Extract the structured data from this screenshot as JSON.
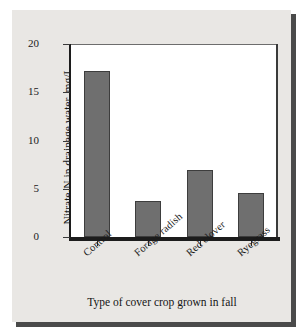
{
  "figure": {
    "background_color": "#e9e7e4",
    "plot_background_color": "#ffffff",
    "bar_color": "#6f6f6f",
    "bar_edge_color": "#3d3d3d",
    "axis_color": "#1c1c1c"
  },
  "chart_data": {
    "type": "bar",
    "title": "",
    "categories": [
      "Control",
      "Forage radish",
      "Red clover",
      "Ryegrass"
    ],
    "values": [
      17.2,
      3.7,
      6.9,
      4.6
    ],
    "series": [
      {
        "name": "Nitrate-N in drainage water",
        "values": [
          17.2,
          3.7,
          6.9,
          4.6
        ]
      }
    ],
    "xlabel": "Type of cover crop grown in fall",
    "ylabel": "Nitrate-N in drainage water, mg/L",
    "ylim": [
      0,
      20
    ],
    "yticks": [
      0,
      5,
      10,
      15,
      20
    ],
    "ytick_labels": [
      "0",
      "5",
      "10",
      "15",
      "20"
    ],
    "grid": false,
    "legend": null,
    "legend_position": "none",
    "annotations": []
  }
}
